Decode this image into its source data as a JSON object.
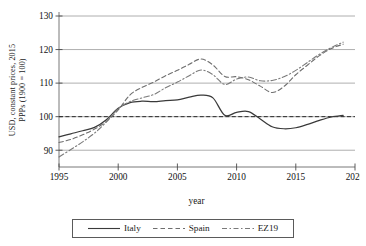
{
  "chart_data": {
    "type": "line",
    "title": "",
    "xlabel": "year",
    "ylabel": "USD, constant prices, 2015\nPPPs (1900 = 100)",
    "xlim": [
      1995,
      2020
    ],
    "ylim": [
      85,
      130
    ],
    "xticks": [
      1995,
      2000,
      2005,
      2010,
      2015,
      2020
    ],
    "yticks": [
      90,
      100,
      110,
      120,
      130
    ],
    "grid": "horizontal",
    "legend_position": "bottom-center",
    "reference_line": {
      "value": 100,
      "style": "dashed"
    },
    "x": [
      1995,
      1996,
      1997,
      1998,
      1999,
      2000,
      2001,
      2002,
      2003,
      2004,
      2005,
      2006,
      2007,
      2008,
      2009,
      2010,
      2011,
      2012,
      2013,
      2014,
      2015,
      2016,
      2017,
      2018,
      2019
    ],
    "series": [
      {
        "name": "Italy",
        "style": "solid",
        "color": "#3a3a3a",
        "values": [
          94.0,
          94.9,
          95.8,
          96.8,
          99.1,
          102.5,
          104.2,
          104.6,
          104.5,
          104.8,
          105.0,
          105.8,
          106.4,
          105.6,
          100.4,
          101.3,
          101.5,
          99.3,
          97.0,
          96.4,
          96.7,
          97.7,
          98.9,
          99.9,
          100.4
        ]
      },
      {
        "name": "Spain",
        "style": "dashed",
        "color": "#6e6e6e",
        "values": [
          92.3,
          93.2,
          94.6,
          96.3,
          98.6,
          102.0,
          106.5,
          108.7,
          110.3,
          112.2,
          113.8,
          115.6,
          117.2,
          115.4,
          112.0,
          111.9,
          111.0,
          109.1,
          107.2,
          109.0,
          112.5,
          115.4,
          118.2,
          120.3,
          121.6
        ]
      },
      {
        "name": "EZ19",
        "style": "dashdot",
        "color": "#7a7a7a",
        "values": [
          88.0,
          90.2,
          92.5,
          95.1,
          98.4,
          102.4,
          104.5,
          105.6,
          106.6,
          108.6,
          110.3,
          112.2,
          113.9,
          112.5,
          109.6,
          111.2,
          111.8,
          110.7,
          110.8,
          111.9,
          113.8,
          116.2,
          118.6,
          120.6,
          122.2
        ]
      }
    ]
  },
  "axis": {
    "ylabel_text": "USD, constant prices, 2015\nPPPs (1900 = 100)",
    "xlabel_text": "year",
    "yticks": [
      "90",
      "100",
      "110",
      "120",
      "130"
    ],
    "xticks": [
      "1995",
      "2000",
      "2005",
      "2010",
      "2015",
      "2020"
    ]
  },
  "legend": {
    "entries": [
      {
        "label": "Italy",
        "style": "solid"
      },
      {
        "label": "Spain",
        "style": "dashed"
      },
      {
        "label": "EZ19",
        "style": "dashdot"
      }
    ]
  }
}
